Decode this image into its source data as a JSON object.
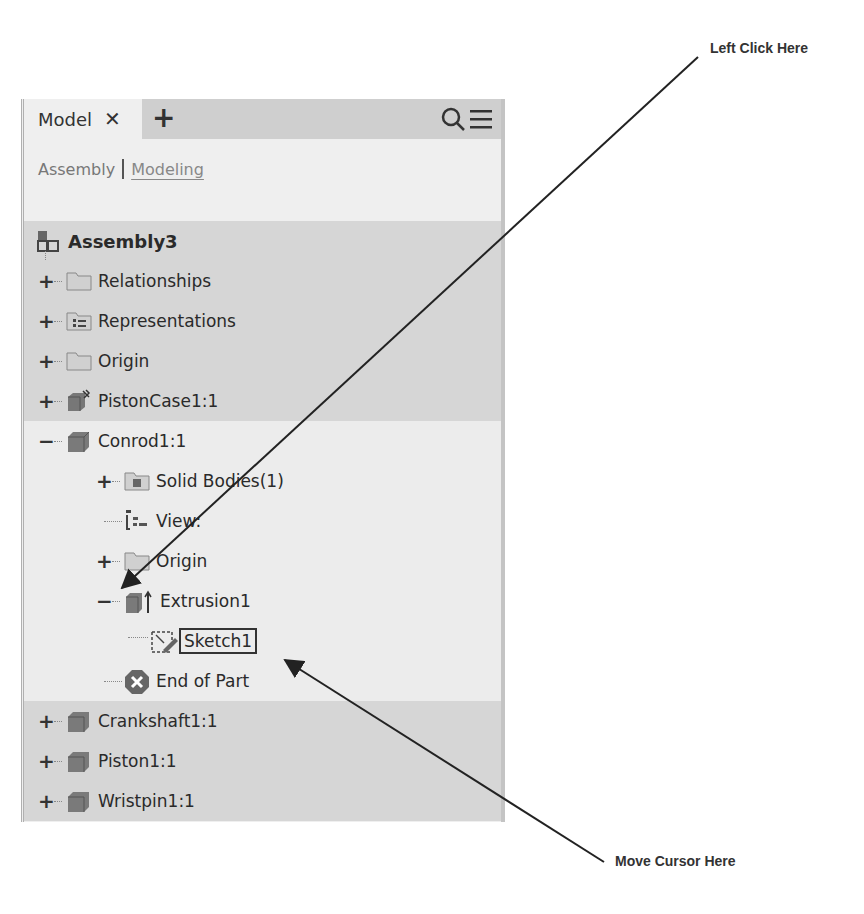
{
  "panel": {
    "tabs": [
      {
        "label": "Model",
        "close_icon": "close-icon"
      }
    ],
    "add_tab_icon": "plus-icon",
    "search_icon": "search-icon",
    "menu_icon": "hamburger-menu-icon",
    "subtabs": [
      {
        "label": "Assembly",
        "active": false
      },
      {
        "label": "Modeling",
        "active": true
      }
    ]
  },
  "tree": {
    "root": {
      "label": "Assembly3",
      "icon": "assembly-icon"
    },
    "items": [
      {
        "label": "Relationships",
        "icon": "folder-icon",
        "expander": "+",
        "level": 1
      },
      {
        "label": "Representations",
        "icon": "representations-folder-icon",
        "expander": "+",
        "level": 1
      },
      {
        "label": "Origin",
        "icon": "folder-icon",
        "expander": "+",
        "level": 1
      },
      {
        "label": "PistonCase1:1",
        "icon": "grounded-part-icon",
        "expander": "+",
        "level": 1
      },
      {
        "label": "Conrod1:1",
        "icon": "part-icon",
        "expander": "−",
        "level": 1
      },
      {
        "label": "Solid Bodies(1)",
        "icon": "solid-bodies-folder-icon",
        "expander": "+",
        "level": 2
      },
      {
        "label": "View:",
        "icon": "view-rep-icon",
        "expander": "",
        "level": 2
      },
      {
        "label": "Origin",
        "icon": "folder-icon",
        "expander": "+",
        "level": 2
      },
      {
        "label": "Extrusion1",
        "icon": "extrusion-icon",
        "expander": "−",
        "level": 2
      },
      {
        "label": "Sketch1",
        "icon": "sketch-icon",
        "expander": "",
        "level": 3,
        "selected": true
      },
      {
        "label": "End of Part",
        "icon": "end-of-part-icon",
        "expander": "",
        "level": 2
      },
      {
        "label": "Crankshaft1:1",
        "icon": "part-icon",
        "expander": "+",
        "level": 1
      },
      {
        "label": "Piston1:1",
        "icon": "part-icon",
        "expander": "+",
        "level": 1
      },
      {
        "label": "Wristpin1:1",
        "icon": "part-icon",
        "expander": "+",
        "level": 1
      }
    ]
  },
  "callouts": {
    "left_click": "Left Click Here",
    "move_cursor": "Move Cursor Here"
  }
}
